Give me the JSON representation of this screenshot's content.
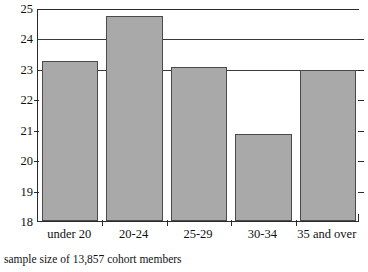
{
  "chart_data": {
    "type": "bar",
    "title": "",
    "subtitle": "",
    "xlabel": "",
    "ylabel": "",
    "categories": [
      "under 20",
      "20-24",
      "25-29",
      "30-34",
      "35 and over"
    ],
    "values": [
      23.25,
      24.75,
      23.05,
      20.85,
      22.95
    ],
    "series": [
      {
        "name": "",
        "values": [
          23.25,
          24.75,
          23.05,
          20.85,
          22.95
        ]
      }
    ],
    "ylim": [
      18,
      25
    ],
    "yticks": [
      18,
      19,
      20,
      21,
      22,
      23,
      24,
      25
    ],
    "ytick_labels": [
      "18",
      "19",
      "20",
      "21",
      "22",
      "23",
      "24",
      "25"
    ],
    "gridlines": [
      23,
      24,
      25
    ],
    "grid": true,
    "legend": false,
    "legend_position": "none",
    "annotations": [
      "sample size of 13,857 cohort members"
    ],
    "bar_color": "#a9a9a9",
    "bar_border_color": "#4a4a4a",
    "axis_color": "#2b2b2b",
    "background": "#ffffff"
  },
  "caption": {
    "text": "sample size of 13,857 cohort members"
  }
}
